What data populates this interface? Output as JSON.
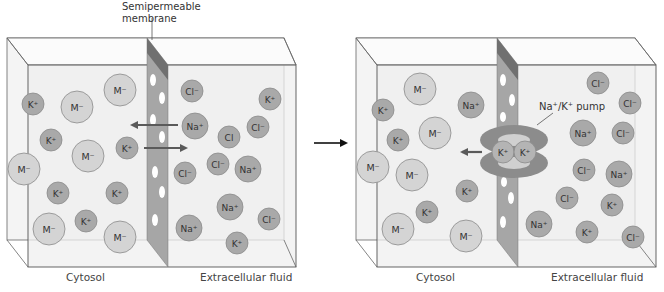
{
  "colors": {
    "box_fill": "#f2f2f2",
    "box_stroke": "#555555",
    "membrane_front": "#a8a8a8",
    "membrane_top": "#777777",
    "cation": "#a9a9a9",
    "anion_large": "#d4d4d4",
    "pump": "#8e8e8e",
    "arrow": "#5a5a5a"
  },
  "labels": {
    "membrane": "Semipermeable\nmembrane",
    "membrane_line1": "Semipermeable",
    "membrane_line2": "membrane",
    "pump": "Na⁺/K⁺ pump",
    "left_cytosol": "Cytosol",
    "left_ecf": "Extracellular fluid",
    "right_cytosol": "Cytosol",
    "right_ecf": "Extracellular fluid"
  },
  "panels": [
    {
      "name": "before",
      "ions": [
        {
          "label": "K⁺",
          "type": "cation",
          "x": 33,
          "y": 104
        },
        {
          "label": "M⁻",
          "type": "anion",
          "x": 77,
          "y": 107
        },
        {
          "label": "M⁻",
          "type": "anion",
          "x": 120,
          "y": 90
        },
        {
          "label": "K⁺",
          "type": "cation",
          "x": 51,
          "y": 140
        },
        {
          "label": "M⁻",
          "type": "anion",
          "x": 88,
          "y": 156
        },
        {
          "label": "K⁺",
          "type": "cation",
          "x": 127,
          "y": 148
        },
        {
          "label": "M⁻",
          "type": "anion",
          "x": 24,
          "y": 169
        },
        {
          "label": "K⁺",
          "type": "cation",
          "x": 58,
          "y": 193
        },
        {
          "label": "K⁺",
          "type": "cation",
          "x": 117,
          "y": 193
        },
        {
          "label": "K⁺",
          "type": "cation",
          "x": 86,
          "y": 221
        },
        {
          "label": "M⁻",
          "type": "anion",
          "x": 49,
          "y": 229
        },
        {
          "label": "M⁻",
          "type": "anion",
          "x": 120,
          "y": 237
        },
        {
          "label": "Cl⁻",
          "type": "cation",
          "x": 192,
          "y": 91
        },
        {
          "label": "K⁺",
          "type": "cation",
          "x": 270,
          "y": 99
        },
        {
          "label": "Na⁺",
          "type": "na",
          "x": 195,
          "y": 126
        },
        {
          "label": "Cl",
          "type": "cation",
          "x": 229,
          "y": 137
        },
        {
          "label": "Cl⁻",
          "type": "cation",
          "x": 258,
          "y": 127
        },
        {
          "label": "Cl⁻",
          "type": "cation",
          "x": 185,
          "y": 173
        },
        {
          "label": "Cl⁻",
          "type": "cation",
          "x": 218,
          "y": 164
        },
        {
          "label": "Na⁺",
          "type": "na",
          "x": 248,
          "y": 169
        },
        {
          "label": "Na⁺",
          "type": "na",
          "x": 230,
          "y": 207
        },
        {
          "label": "Cl⁻",
          "type": "cation",
          "x": 269,
          "y": 219
        },
        {
          "label": "Na⁺",
          "type": "na",
          "x": 189,
          "y": 228
        },
        {
          "label": "K⁺",
          "type": "cation",
          "x": 237,
          "y": 243
        }
      ]
    },
    {
      "name": "after",
      "ions": [
        {
          "label": "M⁻",
          "type": "anion",
          "x": 420,
          "y": 89
        },
        {
          "label": "K⁺",
          "type": "cation",
          "x": 383,
          "y": 110
        },
        {
          "label": "Na⁺",
          "type": "na",
          "x": 471,
          "y": 105
        },
        {
          "label": "M⁻",
          "type": "anion",
          "x": 435,
          "y": 133
        },
        {
          "label": "K⁺",
          "type": "cation",
          "x": 398,
          "y": 140
        },
        {
          "label": "M⁻",
          "type": "anion",
          "x": 373,
          "y": 167
        },
        {
          "label": "M⁻",
          "type": "anion",
          "x": 412,
          "y": 175
        },
        {
          "label": "K⁺",
          "type": "cation",
          "x": 467,
          "y": 191
        },
        {
          "label": "K⁺",
          "type": "cation",
          "x": 427,
          "y": 212
        },
        {
          "label": "M⁻",
          "type": "anion",
          "x": 398,
          "y": 229
        },
        {
          "label": "M⁻",
          "type": "anion",
          "x": 466,
          "y": 236
        },
        {
          "label": "Cl⁻",
          "type": "cation",
          "x": 598,
          "y": 83
        },
        {
          "label": "Cl⁻",
          "type": "cation",
          "x": 630,
          "y": 103
        },
        {
          "label": "Na⁺",
          "type": "na",
          "x": 583,
          "y": 133
        },
        {
          "label": "Cl⁻",
          "type": "cation",
          "x": 623,
          "y": 133
        },
        {
          "label": "Cl⁻",
          "type": "cation",
          "x": 584,
          "y": 170
        },
        {
          "label": "Na⁺",
          "type": "na",
          "x": 619,
          "y": 174
        },
        {
          "label": "Cl⁻",
          "type": "cation",
          "x": 567,
          "y": 198
        },
        {
          "label": "K⁺",
          "type": "cation",
          "x": 612,
          "y": 205
        },
        {
          "label": "Na⁺",
          "type": "na",
          "x": 539,
          "y": 224
        },
        {
          "label": "K⁺",
          "type": "cation",
          "x": 587,
          "y": 232
        },
        {
          "label": "Cl⁻",
          "type": "cation",
          "x": 633,
          "y": 237
        }
      ],
      "pump_ions": [
        {
          "label": "K⁺",
          "x": 503,
          "y": 152
        },
        {
          "label": "K⁺",
          "x": 525,
          "y": 152
        }
      ]
    }
  ]
}
